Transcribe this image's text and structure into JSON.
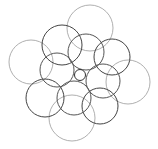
{
  "diagram": {
    "type": "overlapping-circles",
    "background": "#ffffff",
    "circles": [
      {
        "cx": 90,
        "cy": 28,
        "r": 23,
        "stroke": "#9a9a9a",
        "w": 0.8
      },
      {
        "cx": 31,
        "cy": 62,
        "r": 22,
        "stroke": "#9a9a9a",
        "w": 0.8
      },
      {
        "cx": 128,
        "cy": 82,
        "r": 22,
        "stroke": "#9a9a9a",
        "w": 0.8
      },
      {
        "cx": 72,
        "cy": 118,
        "r": 23,
        "stroke": "#9a9a9a",
        "w": 0.8
      },
      {
        "cx": 62,
        "cy": 45,
        "r": 20,
        "stroke": "#444444",
        "w": 1
      },
      {
        "cx": 112,
        "cy": 57,
        "r": 18,
        "stroke": "#444444",
        "w": 1
      },
      {
        "cx": 45,
        "cy": 98,
        "r": 19,
        "stroke": "#444444",
        "w": 1
      },
      {
        "cx": 100,
        "cy": 106,
        "r": 18,
        "stroke": "#444444",
        "w": 1
      },
      {
        "cx": 57,
        "cy": 70,
        "r": 17,
        "stroke": "#555555",
        "w": 1
      },
      {
        "cx": 74,
        "cy": 98,
        "r": 17,
        "stroke": "#555555",
        "w": 1
      },
      {
        "cx": 103,
        "cy": 81,
        "r": 17,
        "stroke": "#555555",
        "w": 1
      },
      {
        "cx": 86,
        "cy": 52,
        "r": 18,
        "stroke": "#555555",
        "w": 1
      },
      {
        "cx": 80,
        "cy": 75,
        "r": 5.5,
        "stroke": "#333333",
        "w": 1
      }
    ]
  }
}
